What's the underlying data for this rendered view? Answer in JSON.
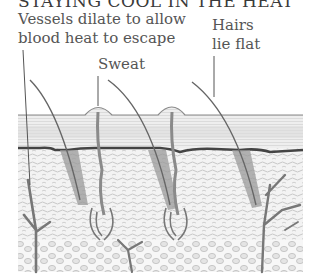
{
  "title": "STAYING COOL IN THE HEAT",
  "labels": {
    "vessels": [
      "Vessels dilate to allow",
      "blood heat to escape"
    ],
    "sweat": "Sweat",
    "hairs": [
      "Hairs",
      "lie flat"
    ]
  },
  "colors": {
    "background": "#ffffff",
    "line": "#666666",
    "dark_line": "#3f3f3f",
    "text": "#555555"
  }
}
